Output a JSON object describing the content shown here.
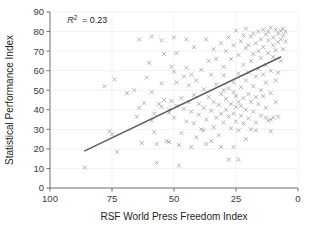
{
  "chart_data": {
    "type": "scatter",
    "title": "",
    "xlabel": "RSF World Press Freedom Index",
    "ylabel": "Statistical Performance Index",
    "xlim": [
      100,
      0
    ],
    "ylim": [
      0,
      90
    ],
    "x_reversed": true,
    "xticks": [
      100,
      75,
      50,
      25,
      0
    ],
    "xtick_labels": [
      "100",
      "75",
      "50",
      "25",
      "0"
    ],
    "yticks": [
      0,
      10,
      20,
      30,
      40,
      50,
      60,
      70,
      80,
      90
    ],
    "ytick_labels": [
      "0",
      "10",
      "20",
      "30",
      "40",
      "50",
      "60",
      "70",
      "80",
      "90"
    ],
    "grid": "both-faint",
    "legend": "none",
    "marker": "x",
    "marker_color": "#9b9b9e",
    "annotations": [
      {
        "name": "r-squared",
        "text": "R2 = 0.23",
        "r_symbol": "R",
        "superscript": "2",
        "equals_value": "= 0.23",
        "x": 93,
        "y": 86
      }
    ],
    "trendline": {
      "type": "linear",
      "color": "#5b5b5f",
      "x_start": 86,
      "y_start": 19,
      "x_end": 7,
      "y_end": 67,
      "r_squared": 0.23
    },
    "points": [
      [
        86,
        10.5
      ],
      [
        78,
        52
      ],
      [
        76,
        29
      ],
      [
        75,
        27.5
      ],
      [
        74,
        55.5
      ],
      [
        73,
        18.5
      ],
      [
        69,
        48.5
      ],
      [
        66,
        50
      ],
      [
        65,
        36.5
      ],
      [
        64,
        41
      ],
      [
        63,
        23
      ],
      [
        62,
        43.5
      ],
      [
        61,
        56.5
      ],
      [
        60,
        64
      ],
      [
        59,
        77.5
      ],
      [
        59,
        34.5
      ],
      [
        58,
        38
      ],
      [
        58,
        28.5
      ],
      [
        57,
        22.5
      ],
      [
        57,
        13
      ],
      [
        56,
        43
      ],
      [
        55,
        41.5
      ],
      [
        55,
        75.5
      ],
      [
        54,
        45
      ],
      [
        54,
        68.5
      ],
      [
        53,
        24
      ],
      [
        52,
        38.5
      ],
      [
        52,
        40
      ],
      [
        51,
        62
      ],
      [
        51,
        44.5
      ],
      [
        50,
        36
      ],
      [
        50,
        59.5
      ],
      [
        50,
        77
      ],
      [
        49,
        54
      ],
      [
        49,
        42
      ],
      [
        48,
        22
      ],
      [
        48,
        11.5
      ],
      [
        47,
        46
      ],
      [
        47,
        28
      ],
      [
        46,
        57
      ],
      [
        46,
        40.5
      ],
      [
        45,
        34
      ],
      [
        45,
        61.5
      ],
      [
        44,
        44
      ],
      [
        44,
        52.5
      ],
      [
        43,
        21
      ],
      [
        43,
        39
      ],
      [
        42,
        47.5
      ],
      [
        42,
        33
      ],
      [
        41,
        55
      ],
      [
        41,
        26
      ],
      [
        40,
        43
      ],
      [
        40,
        37.5
      ],
      [
        39,
        60.5
      ],
      [
        39,
        30
      ],
      [
        38,
        50.5
      ],
      [
        38,
        41
      ],
      [
        37,
        22.5
      ],
      [
        37,
        35
      ],
      [
        36,
        46.5
      ],
      [
        36,
        65
      ],
      [
        35,
        39.5
      ],
      [
        35,
        58
      ],
      [
        34,
        31
      ],
      [
        34,
        44
      ],
      [
        34,
        71
      ],
      [
        33,
        36
      ],
      [
        33,
        53
      ],
      [
        32,
        42.5
      ],
      [
        32,
        27
      ],
      [
        31,
        48
      ],
      [
        31,
        74
      ],
      [
        31,
        38
      ],
      [
        30,
        33.5
      ],
      [
        30,
        57.5
      ],
      [
        30,
        62
      ],
      [
        29,
        40
      ],
      [
        29,
        45.5
      ],
      [
        29,
        70
      ],
      [
        28,
        36.5
      ],
      [
        28,
        51
      ],
      [
        28,
        77
      ],
      [
        27,
        30.5
      ],
      [
        27,
        43
      ],
      [
        27,
        66
      ],
      [
        26,
        38
      ],
      [
        26,
        54
      ],
      [
        26,
        73
      ],
      [
        26,
        21
      ],
      [
        25,
        41.5
      ],
      [
        25,
        47
      ],
      [
        25,
        80.5
      ],
      [
        25,
        34
      ],
      [
        24,
        58.5
      ],
      [
        24,
        44
      ],
      [
        24,
        68
      ],
      [
        24,
        29.5
      ],
      [
        23,
        37
      ],
      [
        23,
        51.5
      ],
      [
        23,
        75
      ],
      [
        23,
        42
      ],
      [
        22,
        63
      ],
      [
        22,
        46
      ],
      [
        22,
        78
      ],
      [
        22,
        33
      ],
      [
        21,
        55
      ],
      [
        21,
        40
      ],
      [
        21,
        71.5
      ],
      [
        21,
        81.5
      ],
      [
        20,
        48
      ],
      [
        20,
        59
      ],
      [
        20,
        35.5
      ],
      [
        20,
        73
      ],
      [
        19,
        44
      ],
      [
        19,
        65
      ],
      [
        19,
        77.5
      ],
      [
        19,
        30
      ],
      [
        18,
        52
      ],
      [
        18,
        68.5
      ],
      [
        18,
        79
      ],
      [
        18,
        39
      ],
      [
        17,
        57
      ],
      [
        17,
        46.5
      ],
      [
        17,
        74
      ],
      [
        17,
        33.5
      ],
      [
        16,
        61
      ],
      [
        16,
        80
      ],
      [
        16,
        43
      ],
      [
        16,
        70
      ],
      [
        15,
        76
      ],
      [
        15,
        50
      ],
      [
        15,
        37
      ],
      [
        15,
        66.5
      ],
      [
        14,
        81
      ],
      [
        14,
        58
      ],
      [
        14,
        47
      ],
      [
        14,
        72
      ],
      [
        13,
        78.5
      ],
      [
        13,
        63
      ],
      [
        13,
        41
      ],
      [
        13,
        54
      ],
      [
        12,
        80
      ],
      [
        12,
        69
      ],
      [
        12,
        34.5
      ],
      [
        12,
        75.5
      ],
      [
        11,
        60
      ],
      [
        11,
        48.5
      ],
      [
        11,
        82
      ],
      [
        11,
        29
      ],
      [
        10,
        77
      ],
      [
        10,
        67
      ],
      [
        10,
        36
      ],
      [
        10,
        73
      ],
      [
        9,
        81
      ],
      [
        9,
        55
      ],
      [
        9,
        70.5
      ],
      [
        9,
        44
      ],
      [
        8,
        79
      ],
      [
        8,
        74.5
      ],
      [
        8,
        59
      ],
      [
        8,
        36.5
      ],
      [
        7,
        80.5
      ],
      [
        7,
        76
      ],
      [
        7,
        65
      ],
      [
        6,
        81.5
      ],
      [
        6,
        78
      ],
      [
        6,
        71
      ],
      [
        5,
        80
      ],
      [
        5,
        75
      ],
      [
        24,
        14.5
      ],
      [
        37,
        76
      ],
      [
        28,
        14.5
      ],
      [
        13,
        36
      ],
      [
        45,
        76
      ],
      [
        64,
        76
      ],
      [
        55,
        53.5
      ],
      [
        59,
        49
      ],
      [
        33,
        66
      ],
      [
        35,
        24
      ],
      [
        31,
        21
      ],
      [
        43,
        58
      ],
      [
        49,
        69
      ],
      [
        21,
        25
      ],
      [
        17,
        29.5
      ],
      [
        26,
        49
      ],
      [
        30,
        50
      ],
      [
        38,
        29.5
      ],
      [
        42,
        72
      ],
      [
        52,
        23.5
      ],
      [
        11,
        35
      ]
    ]
  }
}
